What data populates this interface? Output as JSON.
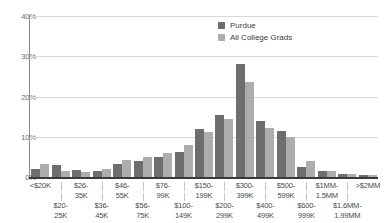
{
  "chart_data": {
    "type": "bar",
    "title": "",
    "subtitle": "",
    "xlabel": "",
    "ylabel": "",
    "ylim": [
      0,
      40
    ],
    "grid": true,
    "legend_position": "top-right",
    "y_ticks": [
      "0%",
      "10%",
      "20%",
      "30%",
      "40%"
    ],
    "y_tick_values": [
      0,
      10,
      20,
      30,
      40
    ],
    "categories": [
      "<$20K",
      "$20-25K",
      "$26-35K",
      "$36-45K",
      "$46-55K",
      "$56-75K",
      "$76-99K",
      "$100-149K",
      "$150-199K",
      "$200-299K",
      "$300-399K",
      "$400-499K",
      "$500-599K",
      "$600-999K",
      "$1MM-1.5MM",
      "$1.6MM-1.99MM",
      ">$2MM"
    ],
    "category_lines": [
      [
        "<$20K",
        ""
      ],
      [
        "$20-",
        "25K"
      ],
      [
        "$26-",
        "35K"
      ],
      [
        "$36-",
        "45K"
      ],
      [
        "$46-",
        "55K"
      ],
      [
        "$56-",
        "75K"
      ],
      [
        "$76-",
        "99K"
      ],
      [
        "$100-",
        "149K"
      ],
      [
        "$150-",
        "199K"
      ],
      [
        "$200-",
        "299K"
      ],
      [
        "$300-",
        "399K"
      ],
      [
        "$400-",
        "499K"
      ],
      [
        "$500-",
        "599K"
      ],
      [
        "$600-",
        "999K"
      ],
      [
        "$1MM-",
        "1.5MM"
      ],
      [
        "$1.6MM-",
        "1.99MM"
      ],
      [
        ">$2MM",
        ""
      ]
    ],
    "series": [
      {
        "name": "Purdue",
        "color": "#6e6e6e",
        "values": [
          2.0,
          3.0,
          1.8,
          1.5,
          3.2,
          4.0,
          5.0,
          6.2,
          12.0,
          15.5,
          28.0,
          13.8,
          11.5,
          2.5,
          1.5,
          0.7,
          0.5
        ]
      },
      {
        "name": "All College Grads",
        "color": "#adadad",
        "values": [
          3.2,
          1.5,
          1.3,
          2.0,
          4.2,
          5.0,
          6.0,
          8.0,
          11.2,
          14.5,
          23.5,
          12.2,
          10.0,
          4.0,
          1.5,
          0.8,
          0.5
        ]
      }
    ]
  },
  "legend": {
    "entries": [
      {
        "label": "Purdue",
        "color": "#6e6e6e"
      },
      {
        "label": "All College Grads",
        "color": "#adadad"
      }
    ]
  }
}
